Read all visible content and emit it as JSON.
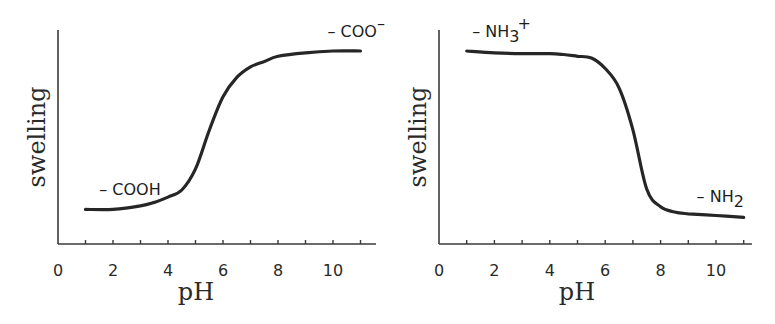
{
  "colors": {
    "curve": "#262626",
    "axis": "#3a3a3a",
    "text": "#2a2a2a",
    "background": "#ffffff"
  },
  "chart_data": [
    {
      "type": "line",
      "title": "",
      "xlabel": "pH",
      "ylabel": "swelling",
      "xlim": [
        0,
        11.5
      ],
      "ylim": [
        0,
        1
      ],
      "grid": false,
      "xticks": [
        0,
        2,
        4,
        6,
        8,
        10
      ],
      "xtick_labels": [
        "0",
        "2",
        "4",
        "6",
        "8",
        "10"
      ],
      "minor_xticks": [
        1,
        3,
        5,
        7,
        9,
        11
      ],
      "yticks": [],
      "series": [
        {
          "name": "anionic (carboxylic acid) hydrogel",
          "x": [
            1,
            2,
            3,
            3.5,
            4,
            4.5,
            5,
            5.5,
            6,
            6.5,
            7,
            7.5,
            8,
            9,
            10,
            11
          ],
          "y": [
            0.1,
            0.1,
            0.12,
            0.14,
            0.17,
            0.21,
            0.33,
            0.55,
            0.74,
            0.85,
            0.91,
            0.94,
            0.97,
            0.99,
            1.0,
            1.0
          ]
        }
      ],
      "annotations": [
        {
          "text": "– COOH",
          "main": "– COOH",
          "sub": "",
          "sup": "",
          "x": 1.5,
          "y": 0.18
        },
        {
          "text": "– COO⁻",
          "main": "– COO",
          "sub": "",
          "sup": "–",
          "x": 9.8,
          "y": 1.08
        }
      ]
    },
    {
      "type": "line",
      "title": "",
      "xlabel": "pH",
      "ylabel": "swelling",
      "xlim": [
        0,
        11.5
      ],
      "ylim": [
        0,
        1
      ],
      "grid": false,
      "xticks": [
        0,
        2,
        4,
        6,
        8,
        10
      ],
      "xtick_labels": [
        "0",
        "2",
        "4",
        "6",
        "8",
        "10"
      ],
      "minor_xticks": [
        1,
        3,
        5,
        7,
        9,
        11
      ],
      "yticks": [],
      "series": [
        {
          "name": "cationic (amine) hydrogel",
          "x": [
            1,
            2,
            3,
            4,
            4.5,
            5,
            5.5,
            6,
            6.5,
            7,
            7.5,
            8,
            8.5,
            9,
            10,
            11
          ],
          "y": [
            1.0,
            0.99,
            0.985,
            0.985,
            0.98,
            0.97,
            0.96,
            0.9,
            0.79,
            0.55,
            0.21,
            0.11,
            0.08,
            0.07,
            0.06,
            0.05
          ]
        }
      ],
      "annotations": [
        {
          "text": "– NH₃⁺",
          "main": "– NH",
          "sub": "3",
          "sup": "+",
          "x": 1.2,
          "y": 1.08
        },
        {
          "text": "– NH₂",
          "main": "– NH",
          "sub": "2",
          "sup": "",
          "x": 9.3,
          "y": 0.14
        }
      ]
    }
  ],
  "panels": [
    {
      "xlabel": "pH",
      "ylabel": "swelling"
    },
    {
      "xlabel": "pH",
      "ylabel": "swelling"
    }
  ]
}
